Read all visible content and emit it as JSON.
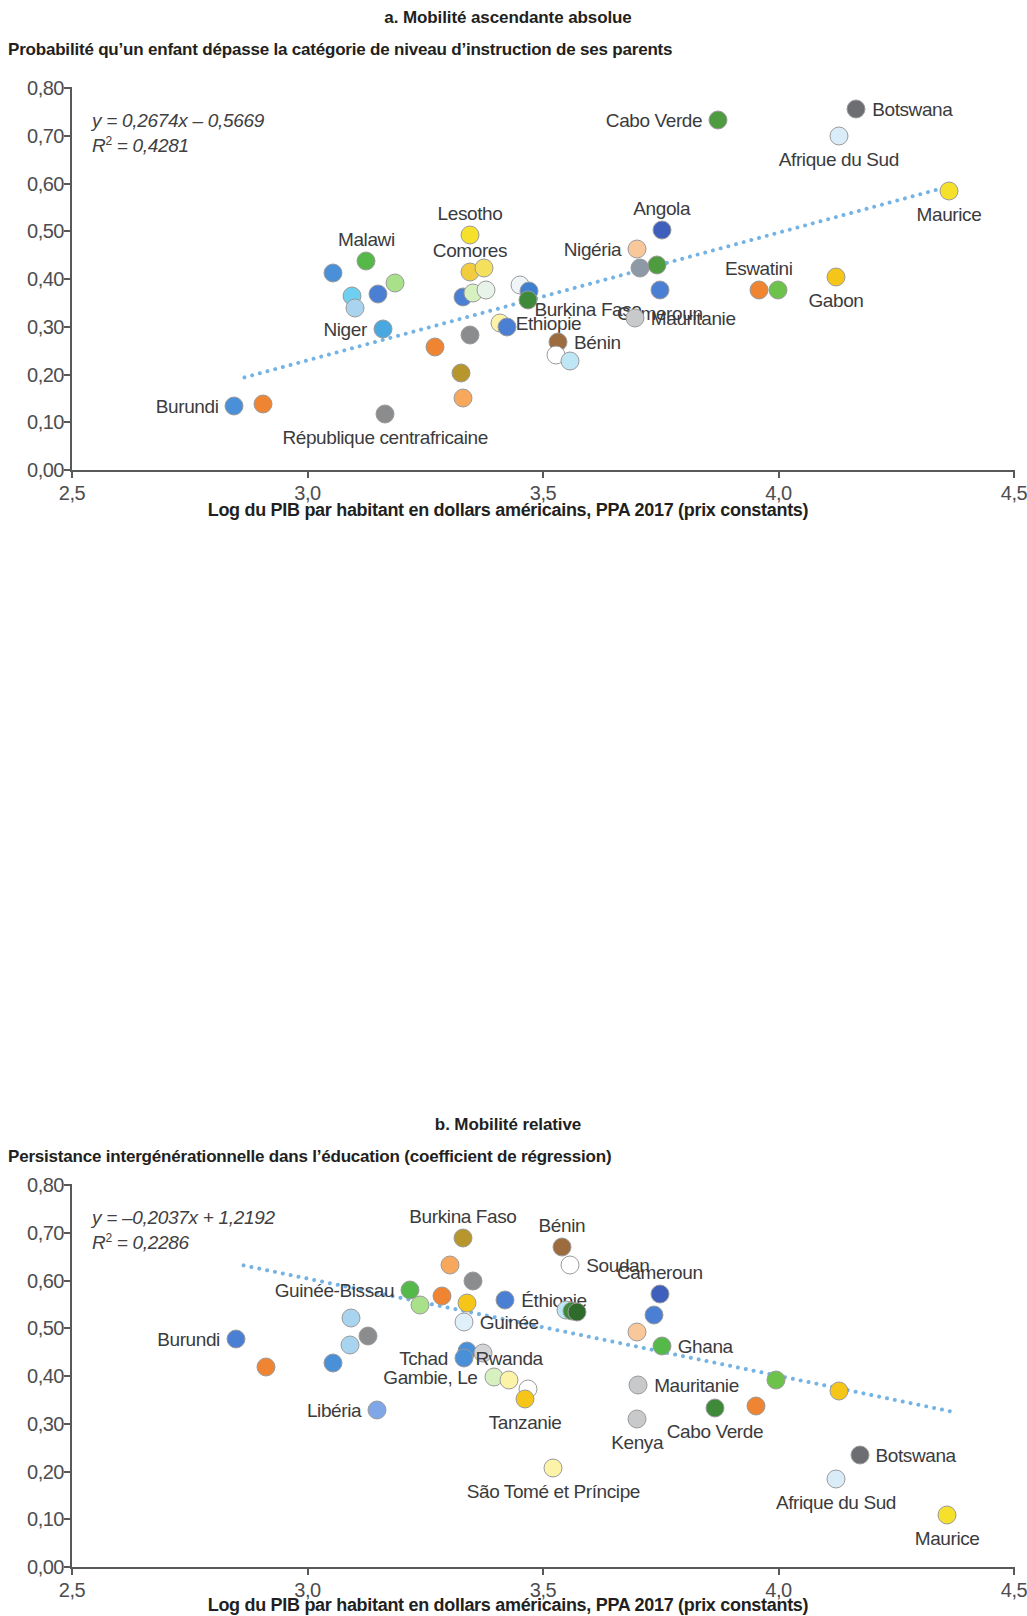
{
  "figure": {
    "x_axis_title": "Log du PIB par habitant en dollars américains, PPA 2017 (prix constants)",
    "x_ticks": [
      "2,5",
      "3,0",
      "3,5",
      "4,0",
      "4,5"
    ],
    "y_ticks": [
      "0,80",
      "0,70",
      "0,60",
      "0,50",
      "0,40",
      "0,30",
      "0,20",
      "0,10",
      "0,00"
    ],
    "trend_color": "#74b3e3"
  },
  "panels": [
    {
      "id": "a",
      "title": "a. Mobilité ascendante absolue",
      "subtitle": "Probabilité qu’un enfant dépasse la catégorie de niveau d’instruction de ses parents",
      "equation": "y = 0,2674x – 0,5669",
      "r_squared": "R² = 0,4281"
    },
    {
      "id": "b",
      "title": "b. Mobilité relative",
      "subtitle": "Persistance intergénérationnelle dans l’éducation (coefficient de régression)",
      "equation": "y = –0,2037x + 1,2192",
      "r_squared": "R² = 0,2286"
    }
  ],
  "chart_data": [
    {
      "type": "scatter",
      "panel": "a",
      "title": "a. Mobilité ascendante absolue",
      "subtitle": "Probabilité qu’un enfant dépasse la catégorie de niveau d’instruction de ses parents",
      "xlabel": "Log du PIB par habitant en dollars américains, PPA 2017 (prix constants)",
      "ylabel": "Probabilité qu’un enfant dépasse la catégorie de niveau d’instruction de ses parents",
      "xlim": [
        2.5,
        4.5
      ],
      "ylim": [
        0.0,
        0.8
      ],
      "xticks": [
        2.5,
        3.0,
        3.5,
        4.0,
        4.5
      ],
      "yticks": [
        0.0,
        0.1,
        0.2,
        0.3,
        0.4,
        0.5,
        0.6,
        0.7,
        0.8
      ],
      "grid": false,
      "legend": "none",
      "trendline": {
        "slope": 0.2674,
        "intercept": -0.5669,
        "r2": 0.4281,
        "style": "dotted",
        "color": "#74b3e3"
      },
      "annotations": [
        "y = 0,2674x – 0,5669",
        "R² = 0,4281"
      ],
      "points": [
        {
          "label": "Burundi",
          "x": 2.845,
          "y": 0.135,
          "color": "#4a90d9",
          "label_pos": "left"
        },
        {
          "label": "",
          "x": 2.905,
          "y": 0.138,
          "color": "#ef8432",
          "label_pos": "none"
        },
        {
          "label": "Malawi",
          "x": 3.125,
          "y": 0.437,
          "color": "#54b948",
          "label_pos": "above"
        },
        {
          "label": "",
          "x": 3.055,
          "y": 0.412,
          "color": "#4a90d9",
          "label_pos": "none"
        },
        {
          "label": "",
          "x": 3.095,
          "y": 0.365,
          "color": "#6fcff0",
          "label_pos": "none"
        },
        {
          "label": "",
          "x": 3.1,
          "y": 0.34,
          "color": "#a8d4f0",
          "label_pos": "none"
        },
        {
          "label": "",
          "x": 3.15,
          "y": 0.368,
          "color": "#4a7fd4",
          "label_pos": "none"
        },
        {
          "label": "",
          "x": 3.185,
          "y": 0.392,
          "color": "#a9e08a",
          "label_pos": "none"
        },
        {
          "label": "Niger",
          "x": 3.16,
          "y": 0.295,
          "color": "#4aa8e0",
          "label_pos": "left"
        },
        {
          "label": "République centrafricaine",
          "x": 3.165,
          "y": 0.118,
          "color": "#8b8c8e",
          "label_pos": "below"
        },
        {
          "label": "",
          "x": 3.27,
          "y": 0.257,
          "color": "#ef8432",
          "label_pos": "none"
        },
        {
          "label": "",
          "x": 3.325,
          "y": 0.203,
          "color": "#b8962e",
          "label_pos": "none"
        },
        {
          "label": "",
          "x": 3.33,
          "y": 0.15,
          "color": "#f7a85c",
          "label_pos": "none"
        },
        {
          "label": "Lesotho",
          "x": 3.345,
          "y": 0.492,
          "color": "#f5e02c",
          "label_pos": "above"
        },
        {
          "label": "Comores",
          "x": 3.345,
          "y": 0.415,
          "color": "#f2cc3f",
          "label_pos": "above"
        },
        {
          "label": "",
          "x": 3.375,
          "y": 0.422,
          "color": "#f5e05e",
          "label_pos": "none"
        },
        {
          "label": "",
          "x": 3.33,
          "y": 0.363,
          "color": "#4a7fd4",
          "label_pos": "none"
        },
        {
          "label": "",
          "x": 3.352,
          "y": 0.37,
          "color": "#d7f0c0",
          "label_pos": "none"
        },
        {
          "label": "",
          "x": 3.38,
          "y": 0.378,
          "color": "#e8f3ea",
          "label_pos": "none"
        },
        {
          "label": "",
          "x": 3.345,
          "y": 0.283,
          "color": "#8b8c8e",
          "label_pos": "none"
        },
        {
          "label": "Ethiopie",
          "x": 3.408,
          "y": 0.307,
          "color": "#fcf2a8",
          "label_pos": "right"
        },
        {
          "label": "",
          "x": 3.423,
          "y": 0.3,
          "color": "#4a7fd4",
          "label_pos": "none"
        },
        {
          "label": "Burkina Faso",
          "x": 3.452,
          "y": 0.388,
          "color": "#eef4f8",
          "label_pos": "belowright"
        },
        {
          "label": "",
          "x": 3.47,
          "y": 0.375,
          "color": "#3f7fd0",
          "label_pos": "none"
        },
        {
          "label": "",
          "x": 3.468,
          "y": 0.355,
          "color": "#3f8a3a",
          "label_pos": "none"
        },
        {
          "label": "Bénin",
          "x": 3.532,
          "y": 0.268,
          "color": "#9c6b3e",
          "label_pos": "right"
        },
        {
          "label": "",
          "x": 3.528,
          "y": 0.24,
          "color": "#ffffff",
          "label_pos": "none"
        },
        {
          "label": "",
          "x": 3.558,
          "y": 0.228,
          "color": "#bfe6f5",
          "label_pos": "none"
        },
        {
          "label": "Nigéria",
          "x": 3.7,
          "y": 0.462,
          "color": "#f9c89a",
          "label_pos": "left"
        },
        {
          "label": "",
          "x": 3.705,
          "y": 0.422,
          "color": "#8d99a6",
          "label_pos": "none"
        },
        {
          "label": "",
          "x": 3.742,
          "y": 0.43,
          "color": "#4f9b3f",
          "label_pos": "none"
        },
        {
          "label": "Angola",
          "x": 3.752,
          "y": 0.503,
          "color": "#3f5fbd",
          "label_pos": "above"
        },
        {
          "label": "Cameroun",
          "x": 3.748,
          "y": 0.378,
          "color": "#4a7fd4",
          "label_pos": "below"
        },
        {
          "label": "Mauritanie",
          "x": 3.695,
          "y": 0.318,
          "color": "#c8c9cb",
          "label_pos": "right"
        },
        {
          "label": "Cabo Verde",
          "x": 3.872,
          "y": 0.733,
          "color": "#4f9b3f",
          "label_pos": "left"
        },
        {
          "label": "Eswatini",
          "x": 3.958,
          "y": 0.378,
          "color": "#ef8432",
          "label_pos": "above"
        },
        {
          "label": "",
          "x": 3.998,
          "y": 0.378,
          "color": "#6cc24a",
          "label_pos": "none"
        },
        {
          "label": "Gabon",
          "x": 4.122,
          "y": 0.405,
          "color": "#f5c518",
          "label_pos": "below"
        },
        {
          "label": "Afrique du Sud",
          "x": 4.128,
          "y": 0.7,
          "color": "#d9ecf7",
          "label_pos": "below"
        },
        {
          "label": "Botswana",
          "x": 4.165,
          "y": 0.757,
          "color": "#6d6e71",
          "label_pos": "right"
        },
        {
          "label": "Maurice",
          "x": 4.362,
          "y": 0.585,
          "color": "#f5e02c",
          "label_pos": "below"
        }
      ]
    },
    {
      "type": "scatter",
      "panel": "b",
      "title": "b. Mobilité relative",
      "subtitle": "Persistance intergénérationnelle dans l’éducation (coefficient de régression)",
      "xlabel": "Log du PIB par habitant en dollars américains, PPA 2017 (prix constants)",
      "ylabel": "Persistance intergénérationnelle dans l’éducation (coefficient de régression)",
      "xlim": [
        2.5,
        4.5
      ],
      "ylim": [
        0.0,
        0.8
      ],
      "xticks": [
        2.5,
        3.0,
        3.5,
        4.0,
        4.5
      ],
      "yticks": [
        0.0,
        0.1,
        0.2,
        0.3,
        0.4,
        0.5,
        0.6,
        0.7,
        0.8
      ],
      "grid": false,
      "legend": "none",
      "trendline": {
        "slope": -0.2037,
        "intercept": 1.2192,
        "r2": 0.2286,
        "style": "dotted",
        "color": "#74b3e3"
      },
      "annotations": [
        "y = –0,2037x + 1,2192",
        "R² = 0,2286"
      ],
      "points": [
        {
          "label": "Burundi",
          "x": 2.848,
          "y": 0.478,
          "color": "#4a7fd4",
          "label_pos": "left"
        },
        {
          "label": "",
          "x": 2.912,
          "y": 0.418,
          "color": "#ef8432",
          "label_pos": "none"
        },
        {
          "label": "",
          "x": 3.055,
          "y": 0.428,
          "color": "#4a90d9",
          "label_pos": "none"
        },
        {
          "label": "",
          "x": 3.092,
          "y": 0.522,
          "color": "#a8d4f0",
          "label_pos": "none"
        },
        {
          "label": "",
          "x": 3.09,
          "y": 0.465,
          "color": "#a8d4f0",
          "label_pos": "none"
        },
        {
          "label": "Libéria",
          "x": 3.148,
          "y": 0.328,
          "color": "#7fa7e8",
          "label_pos": "left"
        },
        {
          "label": "",
          "x": 3.128,
          "y": 0.483,
          "color": "#8b8c8e",
          "label_pos": "none"
        },
        {
          "label": "Guinée-Bissau",
          "x": 3.218,
          "y": 0.58,
          "color": "#54b948",
          "label_pos": "left"
        },
        {
          "label": "",
          "x": 3.238,
          "y": 0.548,
          "color": "#a9e08a",
          "label_pos": "none"
        },
        {
          "label": "",
          "x": 3.285,
          "y": 0.568,
          "color": "#ef8432",
          "label_pos": "none"
        },
        {
          "label": "",
          "x": 3.302,
          "y": 0.632,
          "color": "#f7a85c",
          "label_pos": "none"
        },
        {
          "label": "Burkina Faso",
          "x": 3.33,
          "y": 0.69,
          "color": "#b8962e",
          "label_pos": "above"
        },
        {
          "label": "",
          "x": 3.352,
          "y": 0.598,
          "color": "#8b8c8e",
          "label_pos": "none"
        },
        {
          "label": "",
          "x": 3.338,
          "y": 0.552,
          "color": "#f5c518",
          "label_pos": "none"
        },
        {
          "label": "Guinée",
          "x": 3.332,
          "y": 0.513,
          "color": "#dff0fa",
          "label_pos": "right"
        },
        {
          "label": "",
          "x": 3.338,
          "y": 0.452,
          "color": "#4a90d9",
          "label_pos": "none"
        },
        {
          "label": "Tchad",
          "x": 3.332,
          "y": 0.438,
          "color": "#4a90d9",
          "label_pos": "left"
        },
        {
          "label": "",
          "x": 3.372,
          "y": 0.448,
          "color": "#d4d4d6",
          "label_pos": "none"
        },
        {
          "label": "Gambie, Le",
          "x": 3.395,
          "y": 0.398,
          "color": "#d7f0c0",
          "label_pos": "left"
        },
        {
          "label": "Rwanda",
          "x": 3.428,
          "y": 0.392,
          "color": "#fcf2a8",
          "label_pos": "above"
        },
        {
          "label": "",
          "x": 3.468,
          "y": 0.372,
          "color": "#ffffff",
          "label_pos": "none"
        },
        {
          "label": "Tanzanie",
          "x": 3.462,
          "y": 0.352,
          "color": "#f5c518",
          "label_pos": "below"
        },
        {
          "label": "Éthiopie",
          "x": 3.42,
          "y": 0.56,
          "color": "#4a7fd4",
          "label_pos": "right"
        },
        {
          "label": "Bénin",
          "x": 3.54,
          "y": 0.67,
          "color": "#9c6b3e",
          "label_pos": "above"
        },
        {
          "label": "Soudan",
          "x": 3.558,
          "y": 0.632,
          "color": "#ffffff",
          "label_pos": "right"
        },
        {
          "label": "",
          "x": 3.548,
          "y": 0.538,
          "color": "#bfe6f5",
          "label_pos": "none"
        },
        {
          "label": "",
          "x": 3.562,
          "y": 0.537,
          "color": "#3f8a3a",
          "label_pos": "none"
        },
        {
          "label": "",
          "x": 3.572,
          "y": 0.535,
          "color": "#2f6b2a",
          "label_pos": "none"
        },
        {
          "label": "São Tomé et Príncipe",
          "x": 3.522,
          "y": 0.208,
          "color": "#fcf2a8",
          "label_pos": "below"
        },
        {
          "label": "",
          "x": 3.7,
          "y": 0.492,
          "color": "#f9c89a",
          "label_pos": "none"
        },
        {
          "label": "Mauritanie",
          "x": 3.702,
          "y": 0.382,
          "color": "#c8c9cb",
          "label_pos": "right"
        },
        {
          "label": "Kenya",
          "x": 3.7,
          "y": 0.31,
          "color": "#c8c9cb",
          "label_pos": "below"
        },
        {
          "label": "Cameroun",
          "x": 3.748,
          "y": 0.572,
          "color": "#3f5fbd",
          "label_pos": "above"
        },
        {
          "label": "",
          "x": 3.735,
          "y": 0.528,
          "color": "#4a7fd4",
          "label_pos": "none"
        },
        {
          "label": "Ghana",
          "x": 3.752,
          "y": 0.462,
          "color": "#54b948",
          "label_pos": "right"
        },
        {
          "label": "Cabo Verde",
          "x": 3.865,
          "y": 0.332,
          "color": "#3f8a3a",
          "label_pos": "below"
        },
        {
          "label": "",
          "x": 3.952,
          "y": 0.338,
          "color": "#ef8432",
          "label_pos": "none"
        },
        {
          "label": "",
          "x": 3.995,
          "y": 0.392,
          "color": "#6cc24a",
          "label_pos": "none"
        },
        {
          "label": "",
          "x": 4.128,
          "y": 0.368,
          "color": "#f5c518",
          "label_pos": "none"
        },
        {
          "label": "Botswana",
          "x": 4.172,
          "y": 0.235,
          "color": "#6d6e71",
          "label_pos": "right"
        },
        {
          "label": "Afrique du Sud",
          "x": 4.122,
          "y": 0.185,
          "color": "#d9ecf7",
          "label_pos": "below"
        },
        {
          "label": "Maurice",
          "x": 4.358,
          "y": 0.108,
          "color": "#f5e02c",
          "label_pos": "below"
        }
      ]
    }
  ]
}
